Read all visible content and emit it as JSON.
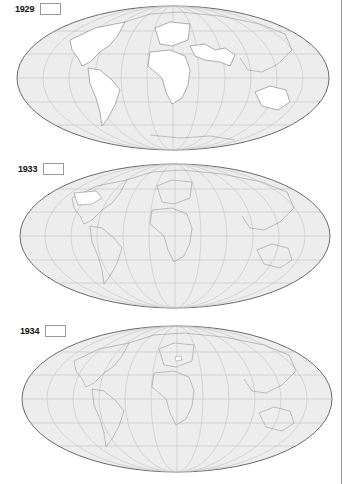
{
  "panels": [
    {
      "year": "1929",
      "legend_swatch_color": "#ffffff",
      "highlighted_regions": [
        "North America",
        "South America",
        "Europe",
        "Africa",
        "Middle East",
        "South Asia",
        "Australia"
      ]
    },
    {
      "year": "1933",
      "legend_swatch_color": "#ffffff",
      "highlighted_regions": [
        "United States"
      ]
    },
    {
      "year": "1934",
      "legend_swatch_color": "#ffffff",
      "highlighted_regions": [
        "Poland"
      ]
    }
  ],
  "colors": {
    "ocean": "#ececec",
    "land": "#eeeeee",
    "highlight": "#ffffff",
    "outline": "#6e6e6e",
    "graticule": "#bdbdbd",
    "border": "#8a8a8a"
  },
  "projection": "Mollweide (world)"
}
